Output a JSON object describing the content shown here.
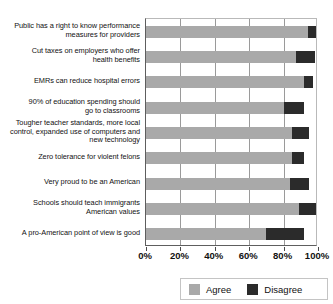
{
  "chart_data": {
    "type": "bar",
    "orientation": "horizontal",
    "stacked": true,
    "title": "",
    "xlabel": "",
    "ylabel": "",
    "xlim": [
      0,
      100
    ],
    "grid": true,
    "legend_position": "bottom-right",
    "xticks": [
      "0%",
      "20%",
      "40%",
      "60%",
      "80%",
      "100%"
    ],
    "xtick_values": [
      0,
      20,
      40,
      60,
      80,
      100
    ],
    "categories": [
      "Public has a right to know performance\nmeasures for providers",
      "Cut taxes on employers who offer\nhealth benefits",
      "EMRs can reduce hospital errors",
      "90% of education spending should\ngo to classrooms",
      "Tougher teacher standards, more local\ncontrol, expanded use of computers and\nnew technology",
      "Zero tolerance for violent felons",
      "Very proud to be an American",
      "Schools should teach immigrants\nAmerican values",
      "A pro-American point of view is good"
    ],
    "series": [
      {
        "name": "Agree",
        "color": "#a9a9a9",
        "values": [
          94,
          87,
          92,
          80,
          85,
          85,
          84,
          89,
          70
        ]
      },
      {
        "name": "Disagree",
        "color": "#2b2b2b",
        "values": [
          5,
          11,
          5,
          12,
          10,
          7,
          11,
          10,
          22
        ]
      }
    ]
  },
  "legend": {
    "items": [
      {
        "label": "Agree"
      },
      {
        "label": "Disagree"
      }
    ]
  }
}
